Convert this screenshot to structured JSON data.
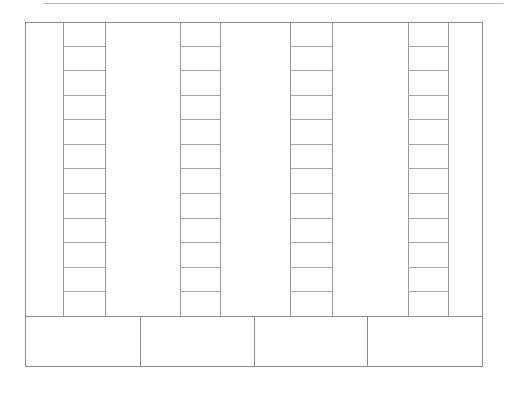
{
  "document": {
    "type": "blank-ruled-form-grid",
    "title": "",
    "width": 506,
    "height": 393,
    "background_color": "#ffffff",
    "line_color": "#8d8d8d",
    "rule_color": "#a6a6a6"
  },
  "top_rule": {
    "name": "page-top-rule",
    "left": 44,
    "top": 3,
    "width": 459,
    "color": "#b7b7b7"
  },
  "table": {
    "left": 25,
    "top": 22,
    "width": 458,
    "height": 345,
    "border_color": "#8d8d8d"
  },
  "body_region": {
    "top": 22,
    "height": 294,
    "columns": [
      {
        "id": "col-1",
        "kind": "plain",
        "left": 0,
        "width": 38,
        "label": ""
      },
      {
        "id": "col-2",
        "kind": "ruled",
        "left": 38,
        "width": 42,
        "rows": 12,
        "label": ""
      },
      {
        "id": "col-3",
        "kind": "plain",
        "left": 80,
        "width": 75,
        "label": ""
      },
      {
        "id": "col-4",
        "kind": "ruled",
        "left": 155,
        "width": 40,
        "rows": 12,
        "label": ""
      },
      {
        "id": "col-5",
        "kind": "plain",
        "left": 195,
        "width": 70,
        "label": ""
      },
      {
        "id": "col-6",
        "kind": "ruled",
        "left": 265,
        "width": 42,
        "rows": 12,
        "label": ""
      },
      {
        "id": "col-7",
        "kind": "plain",
        "left": 307,
        "width": 76,
        "label": ""
      },
      {
        "id": "col-8",
        "kind": "ruled",
        "left": 383,
        "width": 40,
        "rows": 12,
        "label": ""
      },
      {
        "id": "col-9",
        "kind": "plain",
        "left": 423,
        "width": 35,
        "label": ""
      }
    ],
    "row_count": 12,
    "row_values": [
      "",
      "",
      "",
      "",
      "",
      "",
      "",
      "",
      "",
      "",
      "",
      ""
    ]
  },
  "footer_band": {
    "top": 316,
    "height": 51,
    "cells": [
      {
        "id": "footer-cell-1",
        "width": 116,
        "value": ""
      },
      {
        "id": "footer-cell-2",
        "width": 114,
        "value": ""
      },
      {
        "id": "footer-cell-3",
        "width": 113,
        "value": ""
      },
      {
        "id": "footer-cell-4",
        "width": 115,
        "value": ""
      }
    ]
  }
}
